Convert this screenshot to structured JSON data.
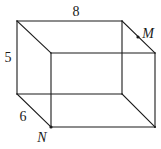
{
  "figure": {
    "type": "rectangular prism (box) wireframe",
    "vertices": {
      "back_top_left": [
        17,
        21
      ],
      "back_top_right": [
        122,
        21
      ],
      "back_bottom_left": [
        17,
        94
      ],
      "back_bottom_right": [
        122,
        94
      ],
      "front_top_left": [
        51,
        53
      ],
      "front_top_right": [
        155,
        53
      ],
      "front_bottom_left": [
        51,
        127
      ],
      "front_bottom_right": [
        155,
        127
      ]
    },
    "dimensions": {
      "length_label": "8",
      "height_label": "5",
      "depth_label": "6"
    },
    "points": {
      "M": {
        "label": "M",
        "position": [
          138,
          37
        ]
      },
      "N": {
        "label": "N",
        "position": [
          51,
          127
        ]
      }
    },
    "colors": {
      "line": "#1a1a1a",
      "background": "#ffffff"
    }
  }
}
